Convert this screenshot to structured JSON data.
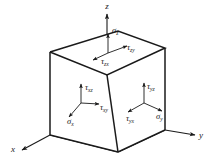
{
  "figure": {
    "type": "stress-element-diagram",
    "background_color": "#ffffff",
    "line_color": "#1a1a1a"
  },
  "axes": [
    {
      "id": "z",
      "label": "z",
      "direction": "up",
      "label_x": 107,
      "label_y": 9
    },
    {
      "id": "x",
      "label": "x",
      "direction": "down-left",
      "label_x": 13,
      "label_y": 152
    },
    {
      "id": "y",
      "label": "y",
      "direction": "right",
      "label_x": 201,
      "label_y": 138
    }
  ],
  "faces": [
    {
      "id": "top-face",
      "name": "z-face",
      "normal_axis": "z",
      "stresses": [
        {
          "id": "sigma-z",
          "sym": "σ",
          "sub": "z",
          "kind": "normal",
          "dir": "up",
          "lx": 112,
          "ly": 33
        },
        {
          "id": "tau-zy",
          "sym": "τ",
          "sub": "zy",
          "kind": "shear",
          "dir": "right",
          "lx": 127,
          "ly": 50
        },
        {
          "id": "tau-zx",
          "sym": "τ",
          "sub": "zx",
          "kind": "shear",
          "dir": "down-left",
          "lx": 101,
          "ly": 64
        }
      ]
    },
    {
      "id": "left-face",
      "name": "x-face",
      "normal_axis": "x",
      "stresses": [
        {
          "id": "tau-xz",
          "sym": "τ",
          "sub": "xz",
          "kind": "shear",
          "dir": "up",
          "lx": 90,
          "ly": 90
        },
        {
          "id": "tau-xy",
          "sym": "τ",
          "sub": "xy",
          "kind": "shear",
          "dir": "right",
          "lx": 99,
          "ly": 109
        },
        {
          "id": "sigma-x",
          "sym": "σ",
          "sub": "x",
          "kind": "normal",
          "dir": "down-left",
          "lx": 73,
          "ly": 123
        }
      ]
    },
    {
      "id": "right-face",
      "name": "y-face",
      "normal_axis": "y",
      "stresses": [
        {
          "id": "tau-yz",
          "sym": "τ",
          "sub": "yz",
          "kind": "shear",
          "dir": "up",
          "lx": 150,
          "ly": 89
        },
        {
          "id": "sigma-y",
          "sym": "σ",
          "sub": "y",
          "kind": "normal",
          "dir": "right",
          "lx": 160,
          "ly": 117
        },
        {
          "id": "tau-yx",
          "sym": "τ",
          "sub": "yx",
          "kind": "shear",
          "dir": "down-left",
          "lx": 131,
          "ly": 119
        }
      ]
    }
  ]
}
